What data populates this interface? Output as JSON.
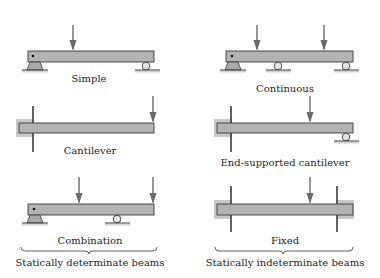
{
  "figure": {
    "beams": [
      {
        "id": "simple",
        "label": "Simple",
        "loads": 1,
        "supports": [
          "pin",
          "roller"
        ]
      },
      {
        "id": "continuous",
        "label": "Continuous",
        "loads": 2,
        "supports": [
          "pin",
          "roller",
          "roller"
        ]
      },
      {
        "id": "cantilever",
        "label": "Cantilever",
        "loads": 1,
        "supports": [
          "fixed-wall"
        ]
      },
      {
        "id": "end-supported-cantilever",
        "label": "End-supported cantilever",
        "loads": 1,
        "supports": [
          "fixed-wall",
          "roller"
        ]
      },
      {
        "id": "combination",
        "label": "Combination",
        "loads": 2,
        "supports": [
          "pin",
          "roller"
        ]
      },
      {
        "id": "fixed",
        "label": "Fixed",
        "loads": 1,
        "supports": [
          "fixed-wall",
          "fixed-wall"
        ]
      }
    ],
    "groups": {
      "left": "Statically determinate beams",
      "right": "Statically indeterminate beams"
    },
    "colors": {
      "beam_fill": "#b3b3b3",
      "outline": "#3a3a3a",
      "load_arrow": "#6a6a6a"
    }
  }
}
